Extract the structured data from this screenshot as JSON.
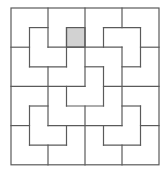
{
  "diagram": {
    "type": "tromino-tiling-grid",
    "grid_size": 8,
    "origin_px": [
      11,
      8
    ],
    "cell_px": [
      18.5,
      19.6
    ],
    "colors": {
      "line": "#5a5a5a",
      "shaded": "#d2d2d2",
      "background": "#ffffff"
    },
    "shaded_cells": [
      [
        3,
        1
      ]
    ],
    "segments": [
      [
        2,
        0,
        2,
        2
      ],
      [
        4,
        0,
        4,
        4
      ],
      [
        6,
        0,
        6,
        1
      ],
      [
        1,
        1,
        2,
        1
      ],
      [
        1,
        1,
        1,
        3
      ],
      [
        0,
        2,
        1,
        2
      ],
      [
        2,
        2,
        6,
        2
      ],
      [
        5,
        1,
        7,
        1
      ],
      [
        5,
        1,
        5,
        2
      ],
      [
        7,
        1,
        7,
        3
      ],
      [
        7,
        2,
        8,
        2
      ],
      [
        3,
        1,
        3,
        3
      ],
      [
        1,
        3,
        3,
        3
      ],
      [
        6,
        2,
        6,
        6
      ],
      [
        4,
        3,
        5,
        3
      ],
      [
        6,
        3,
        7,
        3
      ],
      [
        5,
        3,
        5,
        5
      ],
      [
        5,
        4,
        8,
        4
      ],
      [
        0,
        4,
        4,
        4
      ],
      [
        2,
        3,
        2,
        6
      ],
      [
        3,
        4,
        3,
        5
      ],
      [
        3,
        5,
        5,
        5
      ],
      [
        1,
        5,
        2,
        5
      ],
      [
        1,
        5,
        1,
        7
      ],
      [
        0,
        6,
        1,
        6
      ],
      [
        2,
        6,
        6,
        6
      ],
      [
        3,
        6,
        3,
        7
      ],
      [
        1,
        7,
        3,
        7
      ],
      [
        2,
        7,
        2,
        8
      ],
      [
        4,
        5,
        4,
        8
      ],
      [
        6,
        5,
        7,
        5
      ],
      [
        7,
        5,
        7,
        7
      ],
      [
        7,
        6,
        8,
        6
      ],
      [
        5,
        6,
        5,
        7
      ],
      [
        5,
        7,
        7,
        7
      ],
      [
        6,
        7,
        6,
        8
      ]
    ]
  }
}
